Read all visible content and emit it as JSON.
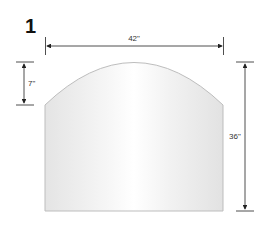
{
  "figure": {
    "number": "1",
    "shape": "arched-top rectangle",
    "dimensions": {
      "width": "42\"",
      "arch_height": "7\"",
      "total_height": "36\""
    },
    "colors": {
      "fill_light": "#ffffff",
      "fill_shade": "#e6e6e6",
      "outline": "#bdbdbd",
      "dimension_lines": "#222222"
    }
  }
}
